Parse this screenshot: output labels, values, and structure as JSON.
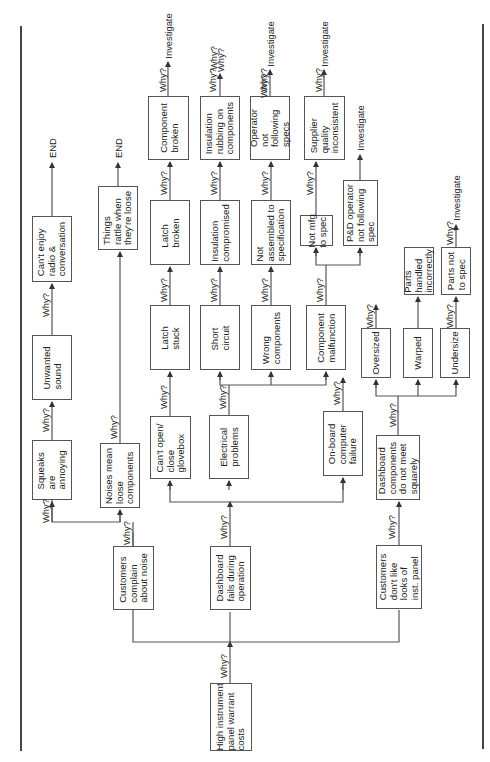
{
  "diagram": {
    "type": "five-whys-tree",
    "orientation": "rotated-90-ccw",
    "root": "High instrument panel warrant costs",
    "why_label": "Why?",
    "end_label": "END",
    "investigate_label": "Investigate",
    "nodes": {
      "root": "High instrument\npanel warrant\ncosts",
      "complain_noise": "Customers\ncomplain\nabout noise",
      "dash_fails": "Dashboard\nfails during\noperation",
      "dont_like_looks": "Customers\ndon't like\nlooks of\ninst. panel",
      "noises_loose": "Noises mean\nloose\ncomponents",
      "squeaks": "Squeaks\nare\nannoying",
      "unwanted_sound": "Unwanted\nsound",
      "cant_enjoy": "Can't enjoy\nradio &\nconversation",
      "things_rattle": "Things\nrattle when\nthey're loose",
      "glovebox": "Can't open/\nclose\nglovebox",
      "latch_stuck": "Latch\nstuck",
      "latch_broken": "Latch\nbroken",
      "component_broken": "Component\nbroken",
      "electrical": "Electrical\nproblems",
      "short_circuit": "Short\ncircuit",
      "insulation_comp": "Insulation\ncompromised",
      "insulation_rub": "Insulation\nrubbing on\ncomponents",
      "wrong_components": "Wrong\ncomponents",
      "not_assembled": "Not\nassembled to\nspecification",
      "operator_specs": "Operator\nnot\nfollowing\nspecs",
      "onboard": "On-board\ncomputer\nfailure",
      "comp_malfunction": "Component\nmalfunction",
      "not_mfg": "Not mfg\nto spec",
      "pd_operator": "P&D operator\nnot following\nspec",
      "supplier": "Supplier\nquality\ninconsistent",
      "dash_squarely": "Dashboard\ncomponents\ndo not meet\nsquarely",
      "oversized": "Oversized",
      "warped": "Warped",
      "undersize": "Undersize",
      "handled": "Parts\nhandled\nincorrectly",
      "parts_not_spec": "Parts not\nto spec"
    },
    "terminals": {
      "end_1": "END",
      "end_2": "END",
      "inv_1": "Investigate",
      "inv_2": "Investigate",
      "inv_3": "Investigate",
      "inv_4": "Investigate",
      "inv_5": "Investigate",
      "why_open_1": "Why?",
      "why_open_2": "Why?"
    },
    "edges": [
      [
        "root",
        "complain_noise"
      ],
      [
        "root",
        "dash_fails"
      ],
      [
        "root",
        "dont_like_looks"
      ],
      [
        "complain_noise",
        "squeaks"
      ],
      [
        "complain_noise",
        "noises_loose"
      ],
      [
        "squeaks",
        "unwanted_sound"
      ],
      [
        "unwanted_sound",
        "cant_enjoy"
      ],
      [
        "cant_enjoy",
        "END"
      ],
      [
        "noises_loose",
        "things_rattle"
      ],
      [
        "things_rattle",
        "END"
      ],
      [
        "dash_fails",
        "glovebox"
      ],
      [
        "dash_fails",
        "electrical"
      ],
      [
        "dash_fails",
        "onboard"
      ],
      [
        "glovebox",
        "latch_stuck"
      ],
      [
        "latch_stuck",
        "latch_broken"
      ],
      [
        "latch_broken",
        "component_broken"
      ],
      [
        "component_broken",
        "Investigate"
      ],
      [
        "electrical",
        "short_circuit"
      ],
      [
        "electrical",
        "wrong_components"
      ],
      [
        "electrical",
        "comp_malfunction"
      ],
      [
        "short_circuit",
        "insulation_comp"
      ],
      [
        "insulation_comp",
        "insulation_rub"
      ],
      [
        "insulation_rub",
        "Why?"
      ],
      [
        "wrong_components",
        "not_assembled"
      ],
      [
        "not_assembled",
        "operator_specs"
      ],
      [
        "operator_specs",
        "Investigate"
      ],
      [
        "comp_malfunction",
        "not_mfg"
      ],
      [
        "comp_malfunction",
        "pd_operator"
      ],
      [
        "not_mfg",
        "supplier"
      ],
      [
        "supplier",
        "Investigate"
      ],
      [
        "pd_operator",
        "Investigate"
      ],
      [
        "onboard",
        "Why?"
      ],
      [
        "dont_like_looks",
        "dash_squarely"
      ],
      [
        "dash_squarely",
        "oversized"
      ],
      [
        "dash_squarely",
        "warped"
      ],
      [
        "dash_squarely",
        "undersize"
      ],
      [
        "oversized",
        "Why?"
      ],
      [
        "warped",
        "handled"
      ],
      [
        "undersize",
        "parts_not_spec"
      ],
      [
        "parts_not_spec",
        "Investigate"
      ]
    ]
  }
}
